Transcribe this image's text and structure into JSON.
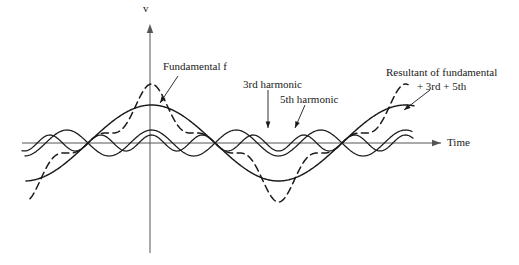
{
  "figure": {
    "axes": {
      "vertical_label": "v",
      "horizontal_label": "Time",
      "origin_x": 150,
      "origin_y": 143
    },
    "annotations": {
      "fundamental": "Fundamental",
      "fundamental_symbol": "f",
      "third_harmonic": "3rd harmonic",
      "fifth_harmonic": "5th harmonic",
      "resultant_line1": "Resultant of fundamental",
      "resultant_line2": "+ 3rd + 5th"
    },
    "colors": {
      "curve": "#1a1a1a",
      "axis": "#555555",
      "text": "#1a1a1a",
      "background": "#ffffff"
    }
  },
  "chart_data": {
    "type": "line",
    "title": "",
    "xlabel": "Time",
    "ylabel": "v",
    "grid": false,
    "legend": "annotations-with-leader-lines",
    "x_axis_y_px": 143,
    "y_axis_x_px": 150,
    "x_domain_px": [
      22,
      415
    ],
    "fundamental_zero_crossings_px": [
      88,
      215,
      342
    ],
    "half_period_px": 127,
    "series": [
      {
        "name": "Fundamental f",
        "style": "solid",
        "harmonic": 1,
        "amplitude_px": 38,
        "phase_deg": 0
      },
      {
        "name": "3rd harmonic",
        "style": "solid",
        "harmonic": 3,
        "amplitude_px": 13,
        "phase_deg": 180
      },
      {
        "name": "5th harmonic",
        "style": "solid",
        "harmonic": 5,
        "amplitude_px": 8,
        "phase_deg": 0
      },
      {
        "name": "Resultant of fundamental + 3rd + 5th",
        "style": "dashed",
        "harmonic": "sum",
        "amplitude_px": 43
      }
    ]
  }
}
